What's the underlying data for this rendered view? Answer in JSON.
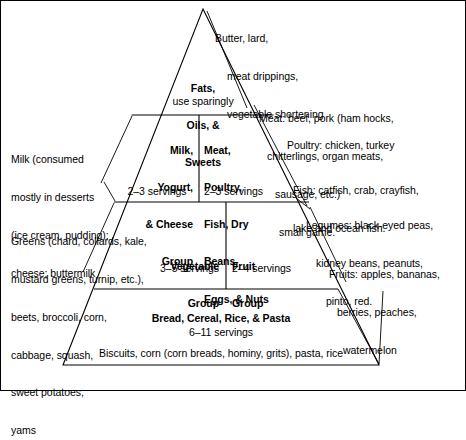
{
  "figure": {
    "type": "food-guide-pyramid-diagram",
    "line_color": "#000000",
    "background_color": "#ffffff",
    "text_color": "#000000"
  },
  "tiers": [
    {
      "id": "tier-fats",
      "name": "Fats, Oils, & Sweets",
      "title_lines": [
        "Fats,",
        "Oils, &",
        "Sweets"
      ],
      "servings": "use sparingly"
    },
    {
      "id": "tier-milk",
      "name": "Milk, Yogurt, & Cheese Group",
      "title_lines": [
        "Milk,",
        "Yogurt,",
        "& Cheese",
        "Group"
      ],
      "servings": "2–3 servings"
    },
    {
      "id": "tier-meat",
      "name": "Meat, Poultry, Fish, Dry Beans, Eggs, & Nuts",
      "title_lines": [
        "Meat,",
        "Poultry,",
        "Fish, Dry",
        "Beans,",
        "Eggs, & Nuts"
      ],
      "servings": "2–3 servings"
    },
    {
      "id": "tier-vegetable",
      "name": "Vegetable Group",
      "title_lines": [
        "Vegetable",
        "Group"
      ],
      "servings": "3–5 servings"
    },
    {
      "id": "tier-fruit",
      "name": "Fruit Group",
      "title_lines": [
        "Fruit",
        "Group"
      ],
      "servings": "2–4 servings"
    },
    {
      "id": "tier-bread",
      "name": "Bread, Cereal, Rice, & Pasta",
      "title_lines": [
        "Bread, Cereal, Rice, & Pasta"
      ],
      "servings": "6–11 servings",
      "examples": "Biscuits, corn (corn breads, hominy, grits), pasta, rice"
    }
  ],
  "callouts": {
    "fats": {
      "id": "callout-fats",
      "lines": [
        "Butter, lard,",
        "meat drippings,",
        "vegetable shortening"
      ]
    },
    "milk": {
      "id": "callout-milk",
      "lines": [
        "Milk (consumed",
        "mostly in desserts",
        "(ice cream, pudding);",
        "cheese; buttermilk"
      ]
    },
    "meat": {
      "id": "callout-meat",
      "lines": [
        "Meat: beef, pork (ham hocks,",
        "chitterlings, organ meats,",
        "sausage, etc.)",
        "small game."
      ]
    },
    "poultry": {
      "id": "callout-poultry",
      "lines": [
        "Poultry: chicken, turkey"
      ]
    },
    "fish": {
      "id": "callout-fish",
      "lines": [
        "Fish: catfish, crab, crayfish,",
        "lake and ocean fish."
      ]
    },
    "legumes": {
      "id": "callout-legumes",
      "lines": [
        "Legumes: black-eyed peas,",
        "kidney beans, peanuts,",
        "pinto, red."
      ]
    },
    "fruits": {
      "id": "callout-fruits",
      "lines": [
        "Fruits: apples, bananas,",
        "berries, peaches,",
        "watermelon"
      ]
    },
    "vegetables": {
      "id": "callout-vegetables",
      "lines": [
        "Greens (chard, collards, kale,",
        "mustard greens, turnip, etc.),",
        "beets, broccoli, corn,",
        "cabbage, squash,",
        "sweet potatoes,",
        "yams"
      ]
    }
  }
}
